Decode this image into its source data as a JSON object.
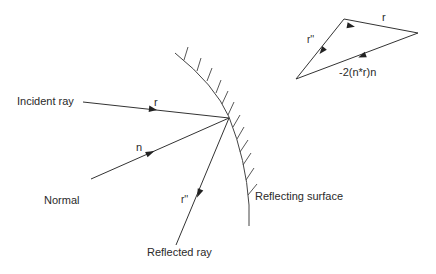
{
  "diagram": {
    "colors": {
      "line": "#333333",
      "text": "#2a2a2a",
      "background": "#ffffff"
    },
    "labels": {
      "incident_ray": "Incident ray",
      "normal": "Normal",
      "reflected_ray": "Reflected ray",
      "reflecting_surface": "Reflecting surface"
    },
    "vectors": {
      "incident": "r",
      "normal": "n",
      "reflected": "r''"
    },
    "triangle": {
      "top_edge": "r",
      "left_edge": "r''",
      "bottom_edge": "-2(n*r)n"
    }
  }
}
